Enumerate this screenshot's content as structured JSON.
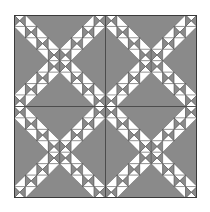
{
  "quilt": {
    "title": "X-pattern quilt block",
    "grid": {
      "blocks_per_side": 2,
      "cells_per_block": 8
    },
    "size_px": 183,
    "colors": {
      "background": "#8a8a8a",
      "light": "#ffffff",
      "seam": "#4a4a4a",
      "border": "#3a3a3a"
    }
  }
}
